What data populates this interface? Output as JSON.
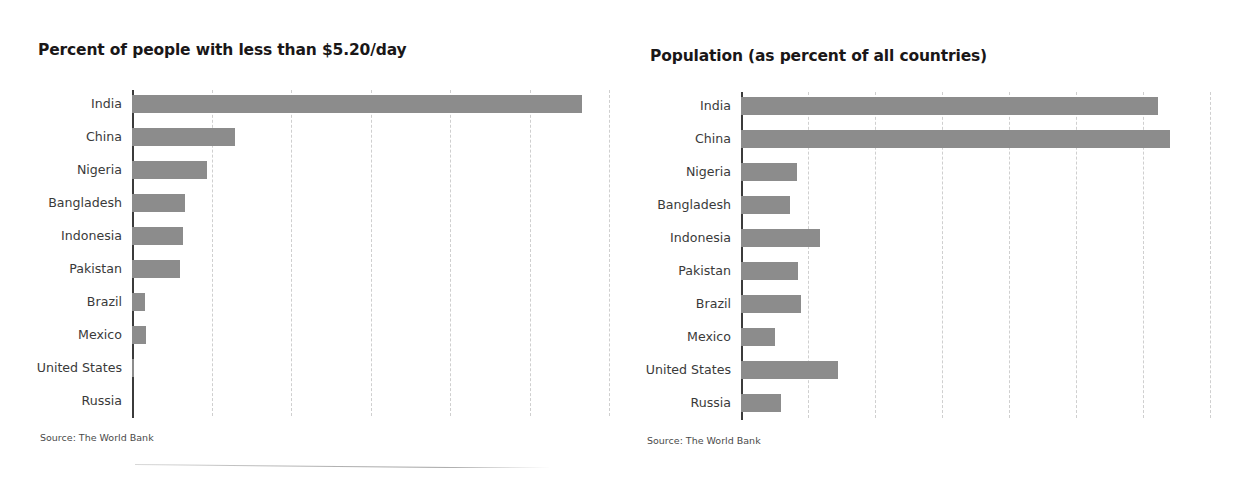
{
  "left_panel": {
    "title": "Percent of people with less than $5.20/day",
    "source": "Source: The World Bank"
  },
  "right_panel": {
    "title": "Population (as percent of all countries)",
    "source": "Source: The World Bank"
  },
  "colors": {
    "bar": "#8c8c8c",
    "axis": "#3b3b3b",
    "gridline": "#cfcfcf",
    "title_text": "#1a1718",
    "label_text": "#3a3a3a"
  },
  "chart_data": [
    {
      "type": "bar",
      "orientation": "horizontal",
      "title": "Percent of people with less than $5.20/day",
      "xlabel": "",
      "ylabel": "",
      "categories": [
        "India",
        "China",
        "Nigeria",
        "Bangladesh",
        "Indonesia",
        "Pakistan",
        "Brazil",
        "Mexico",
        "United States",
        "Russia"
      ],
      "values": [
        5.66,
        1.3,
        0.94,
        0.67,
        0.64,
        0.6,
        0.16,
        0.18,
        0.02,
        0.0
      ],
      "xlim": [
        0,
        6.0
      ],
      "gridlines": [
        1,
        2,
        3,
        4,
        5,
        6
      ],
      "grid": true,
      "legend": "none",
      "axis_tick_labels_visible": false,
      "annotations": [
        "Source: The World Bank"
      ]
    },
    {
      "type": "bar",
      "orientation": "horizontal",
      "title": "Population (as percent of all countries)",
      "xlabel": "",
      "ylabel": "",
      "categories": [
        "India",
        "China",
        "Nigeria",
        "Bangladesh",
        "Indonesia",
        "Pakistan",
        "Brazil",
        "Mexico",
        "United States",
        "Russia"
      ],
      "values": [
        6.22,
        6.4,
        0.84,
        0.73,
        1.18,
        0.85,
        0.9,
        0.51,
        1.45,
        0.6
      ],
      "xlim": [
        0,
        7.0
      ],
      "gridlines": [
        1,
        2,
        3,
        4,
        5,
        6,
        7
      ],
      "grid": true,
      "legend": "none",
      "axis_tick_labels_visible": false,
      "annotations": [
        "Source: The World Bank"
      ]
    }
  ]
}
